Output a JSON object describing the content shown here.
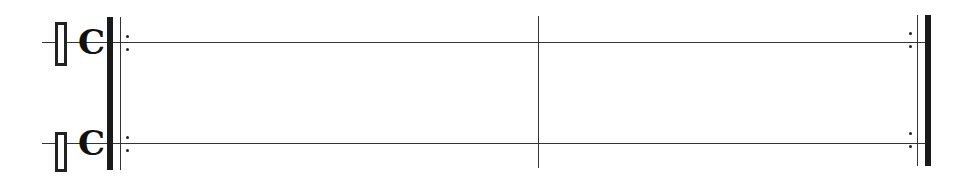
{
  "score": {
    "staves": [
      {
        "name": "staff-1",
        "clef": "percussion-clef",
        "time_signature": "C"
      },
      {
        "name": "staff-2",
        "clef": "percussion-clef",
        "time_signature": "C"
      }
    ],
    "measures": 2,
    "start_barline": "repeat-start",
    "middle_barline": "single",
    "end_barline": "repeat-end",
    "colors": {
      "ink": "#1a1a1a",
      "background": "#ffffff"
    }
  }
}
